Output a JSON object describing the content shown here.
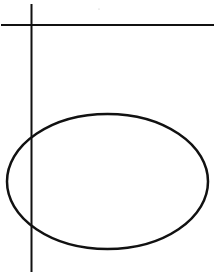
{
  "canvas": {
    "width": 214,
    "height": 274,
    "background": "#ffffff"
  },
  "stroke_color": "#111111",
  "shapes": {
    "horizontal_line": {
      "x1": 1,
      "y1": 25,
      "x2": 214,
      "y2": 25,
      "stroke_width": 2
    },
    "vertical_line": {
      "x1": 31.5,
      "y1": 4,
      "x2": 31.5,
      "y2": 272,
      "stroke_width": 2
    },
    "ellipse": {
      "cx": 107.5,
      "cy": 181.5,
      "rx": 100.5,
      "ry": 67.5,
      "stroke_width": 2.5
    },
    "speck": {
      "cx": 99,
      "cy": 9,
      "r": 0.6,
      "color": "#bbbbbb"
    }
  }
}
